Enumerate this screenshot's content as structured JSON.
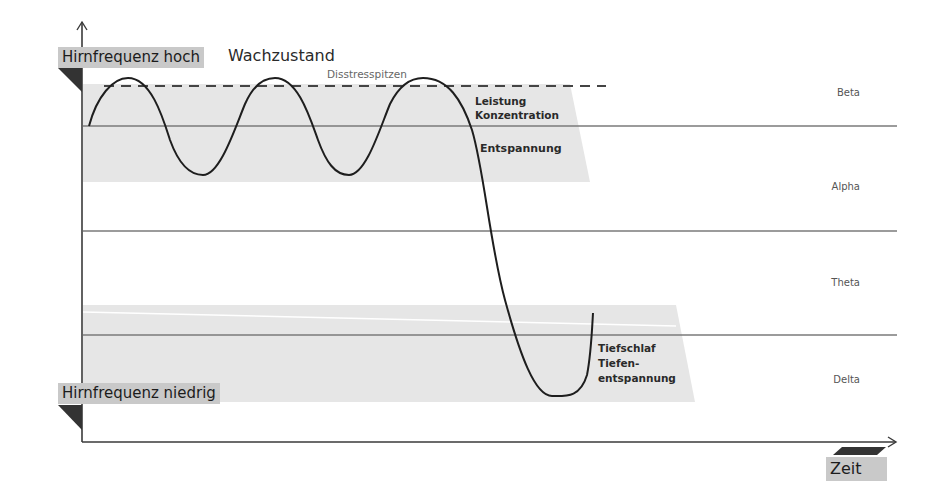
{
  "axes": {
    "y_high_label": "Hirnfrequenz hoch",
    "y_low_label": "Hirnfrequenz niedrig",
    "x_label": "Zeit",
    "state_label": "Wachzustand"
  },
  "annotations": {
    "peak_line": "Disstresspitzen",
    "upper_zone": [
      "Leistung",
      "Konzentration"
    ],
    "relax_zone": "Entspannung",
    "deep_zone": [
      "Tiefschlaf",
      "Tiefen-",
      "entspannung"
    ]
  },
  "bands": [
    {
      "name": "Beta"
    },
    {
      "name": "Alpha"
    },
    {
      "name": "Theta"
    },
    {
      "name": "Delta"
    }
  ],
  "colors": {
    "shade": "#e6e6e6",
    "tag": "#c9c9c9",
    "line": "#6e6e6e",
    "curve": "#1e1e1e",
    "marker": "#333333"
  }
}
